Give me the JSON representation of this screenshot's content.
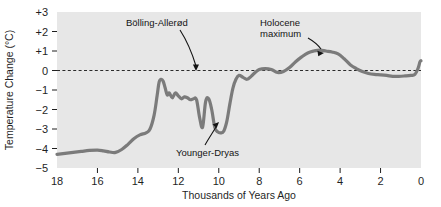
{
  "chart_data": {
    "type": "line",
    "title": "",
    "subtitle": "",
    "xlabel": "Thousands of Years Ago",
    "ylabel": "Temperature Change (°C)",
    "xlim": [
      18,
      0
    ],
    "ylim": [
      -5,
      3
    ],
    "x_inverted": true,
    "grid": false,
    "legend": "none",
    "plot_background": "#e7e7e7",
    "line_color": "#7b7b7b",
    "line_width": 3.2,
    "reference_line": {
      "y": 0,
      "style": "dashed",
      "color": "#2b2b2b"
    },
    "xticks": [
      18,
      16,
      14,
      12,
      10,
      8,
      6,
      4,
      2,
      0
    ],
    "xtick_labels": [
      "18",
      "16",
      "14",
      "12",
      "10",
      "8",
      "6",
      "4",
      "2",
      "0"
    ],
    "yticks": [
      3,
      2,
      1,
      0,
      -1,
      -2,
      -3,
      -4,
      -5
    ],
    "ytick_labels": [
      "+3",
      "+2",
      "+1",
      "0",
      "−1",
      "−2",
      "−3",
      "−4",
      "−5"
    ],
    "series": [
      {
        "name": "Temperature change",
        "x": [
          18.0,
          17.6,
          17.2,
          16.8,
          16.4,
          16.0,
          15.7,
          15.4,
          15.1,
          14.8,
          14.5,
          14.2,
          13.9,
          13.6,
          13.4,
          13.2,
          13.05,
          12.95,
          12.85,
          12.75,
          12.65,
          12.55,
          12.45,
          12.3,
          12.15,
          12.0,
          11.85,
          11.7,
          11.55,
          11.4,
          11.25,
          11.1,
          10.95,
          10.8,
          10.65,
          10.5,
          10.35,
          10.2,
          10.05,
          9.9,
          9.75,
          9.6,
          9.45,
          9.3,
          9.15,
          9.0,
          8.8,
          8.6,
          8.4,
          8.2,
          8.0,
          7.7,
          7.4,
          7.1,
          6.8,
          6.5,
          6.2,
          5.9,
          5.6,
          5.3,
          5.0,
          4.7,
          4.4,
          4.1,
          3.8,
          3.5,
          3.2,
          2.9,
          2.6,
          2.3,
          2.0,
          1.7,
          1.4,
          1.1,
          0.8,
          0.5,
          0.3,
          0.15,
          0.05,
          0.0
        ],
        "y": [
          -4.3,
          -4.25,
          -4.2,
          -4.15,
          -4.1,
          -4.08,
          -4.12,
          -4.18,
          -4.2,
          -4.05,
          -3.8,
          -3.5,
          -3.3,
          -3.2,
          -3.0,
          -2.3,
          -1.3,
          -0.6,
          -0.45,
          -0.55,
          -0.9,
          -1.25,
          -1.15,
          -1.4,
          -1.15,
          -1.3,
          -1.45,
          -1.35,
          -1.4,
          -1.5,
          -1.45,
          -1.5,
          -2.4,
          -2.9,
          -1.6,
          -1.45,
          -2.0,
          -2.9,
          -3.15,
          -3.2,
          -3.1,
          -2.6,
          -1.7,
          -0.9,
          -0.45,
          -0.25,
          -0.35,
          -0.45,
          -0.3,
          -0.1,
          0.05,
          0.1,
          0.05,
          -0.1,
          -0.05,
          0.15,
          0.45,
          0.7,
          0.9,
          1.0,
          1.05,
          1.0,
          0.95,
          0.85,
          0.6,
          0.3,
          0.1,
          -0.05,
          -0.15,
          -0.2,
          -0.22,
          -0.25,
          -0.3,
          -0.3,
          -0.28,
          -0.25,
          -0.2,
          0.1,
          0.45,
          0.5
        ]
      }
    ],
    "annotations": [
      {
        "label": "Bölling-Allerød",
        "target_x": 12.85,
        "target_y": -0.45,
        "note": "warm interval marked by arrow to first major peak"
      },
      {
        "label": "Younger-Dryas",
        "target_x": 9.95,
        "target_y": -3.1,
        "note": "cold reversal marked by arrow to deep trough"
      },
      {
        "label": "Holocene\nmaximum",
        "label_line1": "Holocene",
        "label_line2": "maximum",
        "target_x": 5.7,
        "target_y": 0.95,
        "note": "arrow to broad mid-Holocene warm peak"
      }
    ]
  },
  "axes": {
    "y_title": "Temperature Change (°C)",
    "x_title": "Thousands of Years Ago"
  },
  "annotation_labels": {
    "bolling_allerod": "Bölling-Allerød",
    "younger_dryas": "Younger-Dryas",
    "holocene_line1": "Holocene",
    "holocene_line2": "maximum"
  }
}
